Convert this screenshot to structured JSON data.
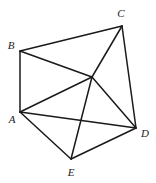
{
  "figure": {
    "type": "geometry-diagram",
    "width": 156,
    "height": 183,
    "background_color": "#ffffff",
    "line_color": "#1a1a1a",
    "line_width": 1.5
  },
  "vertices": [
    {
      "id": "A",
      "label": "A",
      "x": 20,
      "y": 112,
      "label_x": 12,
      "label_y": 119,
      "labeled": true
    },
    {
      "id": "B",
      "label": "B",
      "x": 20,
      "y": 51,
      "label_x": 11,
      "label_y": 45,
      "labeled": true
    },
    {
      "id": "C",
      "label": "C",
      "x": 122,
      "y": 26,
      "label_x": 121,
      "label_y": 13,
      "labeled": true
    },
    {
      "id": "D",
      "label": "D",
      "x": 136,
      "y": 128,
      "label_x": 145,
      "label_y": 133,
      "labeled": true
    },
    {
      "id": "E",
      "label": "E",
      "x": 71,
      "y": 159,
      "label_x": 71,
      "label_y": 172,
      "labeled": true
    },
    {
      "id": "F",
      "label": "",
      "x": 92,
      "y": 77,
      "label_x": 92,
      "label_y": 77,
      "labeled": false
    }
  ],
  "edges": [
    {
      "id": "edge-AB",
      "from": "A",
      "to": "B"
    },
    {
      "id": "edge-BC",
      "from": "B",
      "to": "C"
    },
    {
      "id": "edge-CD",
      "from": "C",
      "to": "D"
    },
    {
      "id": "edge-DE",
      "from": "D",
      "to": "E"
    },
    {
      "id": "edge-EA",
      "from": "E",
      "to": "A"
    },
    {
      "id": "edge-AD",
      "from": "A",
      "to": "D"
    },
    {
      "id": "edge-AF",
      "from": "A",
      "to": "F"
    },
    {
      "id": "edge-BF",
      "from": "B",
      "to": "F"
    },
    {
      "id": "edge-CF",
      "from": "C",
      "to": "F"
    },
    {
      "id": "edge-DF",
      "from": "D",
      "to": "F"
    },
    {
      "id": "edge-EF",
      "from": "E",
      "to": "F"
    }
  ]
}
